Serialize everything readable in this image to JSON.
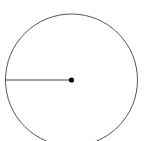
{
  "diagram": {
    "type": "circle-with-radius",
    "circle": {
      "cx": 71.5,
      "cy": 80,
      "r": 66,
      "stroke": "#555555",
      "stroke_width": 1
    },
    "radius_line": {
      "x1": 5.5,
      "y1": 80,
      "x2": 71.5,
      "y2": 80,
      "stroke": "#444444",
      "stroke_width": 1
    },
    "center_point": {
      "cx": 71.5,
      "cy": 80,
      "r": 2.6,
      "fill": "#000000"
    }
  }
}
